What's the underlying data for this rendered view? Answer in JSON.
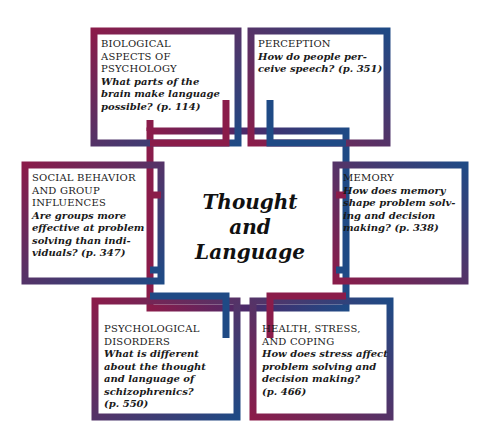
{
  "diagram": {
    "title": "Thought and\nLanguage",
    "colors": {
      "crimson": "#8a1c4a",
      "navy": "#1f4a85",
      "background": "#ffffff"
    },
    "boxes": [
      {
        "id": "biological",
        "heading": "BIOLOGICAL\nASPECTS OF\nPSYCHOLOGY",
        "question": "What parts of the\nbrain make language\npossible? (p. 114)"
      },
      {
        "id": "perception",
        "heading": "PERCEPTION",
        "question": "How do people per-\nceive speech? (p. 351)"
      },
      {
        "id": "social",
        "heading": "SOCIAL BEHAVIOR\nAND GROUP\nINFLUENCES",
        "question": "Are groups more\neffective at problem\nsolving than indi-\nviduals? (p. 347)"
      },
      {
        "id": "memory",
        "heading": "MEMORY",
        "question": "How does memory\nshape problem solv-\ning and decision\nmaking? (p. 338)"
      },
      {
        "id": "disorders",
        "heading": "PSYCHOLOGICAL\nDISORDERS",
        "question": "What is different\nabout the thought\nand language of\nschizophrenics?\n(p. 550)"
      },
      {
        "id": "health",
        "heading": "HEALTH, STRESS,\nAND COPING",
        "question": "How does stress affect\nproblem solving and\ndecision making?\n(p. 466)"
      }
    ]
  }
}
